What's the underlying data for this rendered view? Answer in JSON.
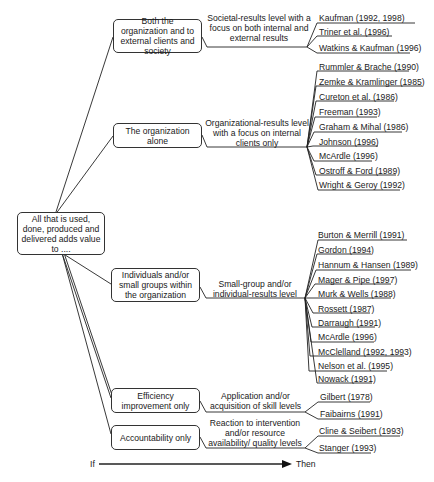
{
  "diagram": {
    "root": {
      "label": "All that is used, done, produced and delivered adds value to ...."
    },
    "branches": [
      {
        "target": "Both the organization and to external clients and society",
        "level": "Societal-results level with a focus on both internal and external results",
        "references": [
          "Kaufman (1992, 1998)",
          "Triner et al. (1996)",
          "Watkins & Kaufman (1996)"
        ]
      },
      {
        "target": "The organization alone",
        "level": "Organizational-results level with a focus on internal clients only",
        "references": [
          "Rummler & Brache (1990)",
          "Zemke & Kramlinger (1985)",
          "Cureton et al. (1986)",
          "Freeman (1993)",
          "Graham & Mihal (1986)",
          "Johnson (1996)",
          "McArdle (1996)",
          "Ostroff & Ford (1989)",
          "Wright & Geroy (1992)"
        ]
      },
      {
        "target": "Individuals and/or small groups within the organization",
        "level": "Small-group and/or individual-results level",
        "references": [
          "Burton & Merrill (1991)",
          "Gordon (1994)",
          "Hannum & Hansen (1989)",
          "Mager & Pipe (1997)",
          "Murk & Wells (1988)",
          "Rossett (1987)",
          "Darraugh (1991)",
          "McArdle (1996)",
          "McClelland (1992, 1993)",
          "Nelson et al. (1995)",
          "Nowack (1991)"
        ]
      },
      {
        "target": "Efficiency improvement only",
        "level": "Application and/or acquisition of skill levels",
        "references": [
          "Gilbert (1978)",
          "Faibairns (1991)"
        ]
      },
      {
        "target": "Accountability only",
        "level": "Reaction to intervention and/or resource availability/ quality levels",
        "references": [
          "Cline & Seibert (1993)",
          "Stanger (1993)"
        ]
      }
    ],
    "axis": {
      "start": "If",
      "end": "Then"
    }
  }
}
